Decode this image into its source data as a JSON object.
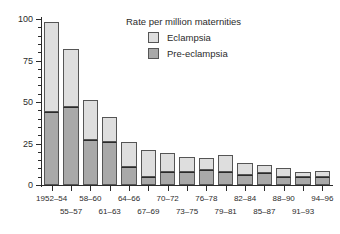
{
  "chart_data": {
    "type": "bar",
    "subtype": "stacked-bar",
    "title": "",
    "legend_title": "Rate per million maternities",
    "legend_position": "top-right-inside",
    "xlabel": "",
    "ylabel": "",
    "ylim": [
      0,
      100
    ],
    "yticks": [
      0,
      25,
      50,
      75,
      100
    ],
    "ytick_labels": [
      "0",
      "25",
      "50",
      "75",
      "100"
    ],
    "yminor_step": 5,
    "grid": false,
    "categories": [
      "1952–54",
      "55–57",
      "58–60",
      "61–63",
      "64–66",
      "67–69",
      "70–72",
      "73–75",
      "76–78",
      "79–81",
      "82–84",
      "85–87",
      "88–90",
      "91–93",
      "94–96"
    ],
    "series": [
      {
        "name": "Pre-eclampsia",
        "color": "#a9a9a9",
        "values": [
          44,
          47,
          27,
          26,
          11,
          5,
          8,
          8,
          9,
          8,
          6,
          7,
          5,
          5,
          5
        ]
      },
      {
        "name": "Eclampsia",
        "color": "#dedede",
        "values": [
          54,
          35,
          24,
          15,
          15,
          16,
          11.5,
          9,
          7,
          10,
          7,
          5,
          5.5,
          3,
          3.5
        ]
      }
    ],
    "totals": [
      98,
      82,
      51,
      41,
      26,
      21,
      19.5,
      17,
      16,
      18,
      13,
      12,
      10.5,
      8,
      8.5
    ],
    "stack_order": [
      "Pre-eclampsia",
      "Eclampsia"
    ]
  },
  "legend": {
    "title": "Rate per million maternities",
    "entries": [
      {
        "label": "Eclampsia",
        "color": "#dedede"
      },
      {
        "label": "Pre-eclampsia",
        "color": "#a9a9a9"
      }
    ]
  },
  "axes": {
    "y": {
      "labels": [
        "100",
        "75",
        "50",
        "25",
        "0"
      ]
    }
  }
}
